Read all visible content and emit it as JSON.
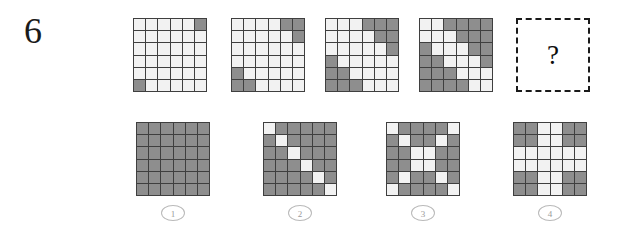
{
  "puzzle": {
    "number": "6",
    "answer_placeholder": "?",
    "colors": {
      "cell_light": "#f2f2f2",
      "cell_dark": "#8e8e8e",
      "grid_line": "#3f3f3f",
      "text": "#1a1a1a",
      "label_outline": "#b9b9b9"
    },
    "grid_size": 6
  },
  "sequence": [
    {
      "name": "sequence-grid-1",
      "left": 133,
      "top": 18,
      "cells": [
        [
          0,
          0,
          0,
          0,
          0,
          1
        ],
        [
          0,
          0,
          0,
          0,
          0,
          0
        ],
        [
          0,
          0,
          0,
          0,
          0,
          0
        ],
        [
          0,
          0,
          0,
          0,
          0,
          0
        ],
        [
          0,
          0,
          0,
          0,
          0,
          0
        ],
        [
          1,
          0,
          0,
          0,
          0,
          0
        ]
      ]
    },
    {
      "name": "sequence-grid-2",
      "left": 231,
      "top": 18,
      "cells": [
        [
          0,
          0,
          0,
          0,
          1,
          1
        ],
        [
          0,
          0,
          0,
          0,
          0,
          1
        ],
        [
          0,
          0,
          0,
          0,
          0,
          0
        ],
        [
          0,
          0,
          0,
          0,
          0,
          0
        ],
        [
          1,
          0,
          0,
          0,
          0,
          0
        ],
        [
          1,
          1,
          0,
          0,
          0,
          0
        ]
      ]
    },
    {
      "name": "sequence-grid-3",
      "left": 325,
      "top": 18,
      "cells": [
        [
          0,
          0,
          0,
          1,
          1,
          1
        ],
        [
          0,
          0,
          0,
          0,
          1,
          1
        ],
        [
          0,
          0,
          0,
          0,
          0,
          1
        ],
        [
          1,
          0,
          0,
          0,
          0,
          0
        ],
        [
          1,
          1,
          0,
          0,
          0,
          0
        ],
        [
          1,
          1,
          1,
          0,
          0,
          0
        ]
      ]
    },
    {
      "name": "sequence-grid-4",
      "left": 419,
      "top": 18,
      "cells": [
        [
          0,
          0,
          1,
          1,
          1,
          1
        ],
        [
          0,
          0,
          0,
          1,
          1,
          1
        ],
        [
          1,
          0,
          0,
          0,
          1,
          1
        ],
        [
          1,
          1,
          0,
          0,
          0,
          1
        ],
        [
          1,
          1,
          1,
          0,
          0,
          0
        ],
        [
          1,
          1,
          1,
          1,
          0,
          0
        ]
      ]
    }
  ],
  "answer_slot": {
    "name": "answer-slot",
    "left": 516,
    "top": 18,
    "mark": "?"
  },
  "options": [
    {
      "name": "option-1",
      "label": "1",
      "left": 136,
      "top": 122,
      "cells": [
        [
          1,
          1,
          1,
          1,
          1,
          1
        ],
        [
          1,
          1,
          1,
          1,
          1,
          1
        ],
        [
          1,
          1,
          1,
          1,
          1,
          1
        ],
        [
          1,
          1,
          1,
          1,
          1,
          1
        ],
        [
          1,
          1,
          1,
          1,
          1,
          1
        ],
        [
          1,
          1,
          1,
          1,
          1,
          1
        ]
      ]
    },
    {
      "name": "option-2",
      "label": "2",
      "left": 263,
      "top": 122,
      "cells": [
        [
          0,
          1,
          1,
          1,
          1,
          1
        ],
        [
          1,
          0,
          1,
          1,
          1,
          1
        ],
        [
          1,
          1,
          0,
          1,
          1,
          1
        ],
        [
          1,
          1,
          1,
          0,
          1,
          1
        ],
        [
          1,
          1,
          1,
          1,
          0,
          1
        ],
        [
          1,
          1,
          1,
          1,
          1,
          0
        ]
      ]
    },
    {
      "name": "option-3",
      "label": "3",
      "left": 386,
      "top": 122,
      "cells": [
        [
          0,
          1,
          1,
          1,
          1,
          0
        ],
        [
          1,
          0,
          1,
          1,
          0,
          1
        ],
        [
          1,
          1,
          0,
          0,
          1,
          1
        ],
        [
          1,
          1,
          0,
          0,
          1,
          1
        ],
        [
          1,
          0,
          1,
          1,
          0,
          1
        ],
        [
          0,
          1,
          1,
          1,
          1,
          0
        ]
      ]
    },
    {
      "name": "option-4",
      "label": "4",
      "left": 513,
      "top": 122,
      "cells": [
        [
          1,
          1,
          0,
          0,
          1,
          1
        ],
        [
          1,
          1,
          0,
          0,
          1,
          1
        ],
        [
          0,
          0,
          0,
          0,
          0,
          0
        ],
        [
          0,
          0,
          0,
          0,
          0,
          0
        ],
        [
          1,
          1,
          0,
          0,
          1,
          1
        ],
        [
          1,
          1,
          0,
          0,
          1,
          1
        ]
      ]
    }
  ]
}
